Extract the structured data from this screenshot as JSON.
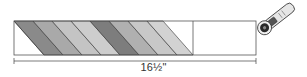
{
  "diagram": {
    "dimension_label": "16½\"",
    "strip": {
      "x": 14,
      "y": 21,
      "width": 242,
      "height": 34,
      "divider_x": 193,
      "stroke": "#555555"
    },
    "stripes": [
      {
        "top_x": 14,
        "fill": "#8a8a8a"
      },
      {
        "top_x": 33,
        "fill": "#a9a9a9"
      },
      {
        "top_x": 52,
        "fill": "#c4c4c4"
      },
      {
        "top_x": 71,
        "fill": "#cdcdcd"
      },
      {
        "top_x": 90,
        "fill": "#7d7d7d"
      },
      {
        "top_x": 109,
        "fill": "#b0b0b0"
      },
      {
        "top_x": 128,
        "fill": "#c8c8c8"
      },
      {
        "top_x": 147,
        "fill": "#d2d2d2"
      }
    ],
    "stripe_end_top_x": 163,
    "slant_offset": 30,
    "tool": "rotary-cutter",
    "colors": {
      "line": "#444444",
      "background": "#ffffff"
    }
  }
}
